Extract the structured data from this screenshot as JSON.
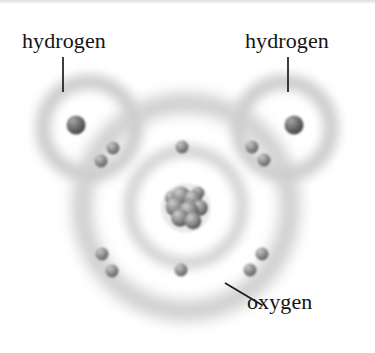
{
  "figure": {
    "background_color": "#ffffff",
    "ink_color": "#141414",
    "shell_color": "#b9b9b9",
    "electron_color": "#8a8a8a",
    "nucleus_color": "#707070",
    "width": 375,
    "height": 353
  },
  "labels": {
    "hydrogen_left": "hydrogen",
    "hydrogen_right": "hydrogen",
    "oxygen": "oxygen"
  },
  "leader_lines": [
    {
      "name": "hydrogen-left-leader",
      "x1": 63,
      "y1": 57,
      "x2": 63,
      "y2": 92
    },
    {
      "name": "hydrogen-right-leader",
      "x1": 288,
      "y1": 57,
      "x2": 288,
      "y2": 92
    },
    {
      "name": "oxygen-leader",
      "x1": 225,
      "y1": 283,
      "x2": 262,
      "y2": 305
    }
  ],
  "atoms": {
    "oxygen": {
      "name": "oxygen",
      "nucleus": {
        "cx": 186,
        "cy": 207,
        "r": 23
      },
      "shells": [
        {
          "name": "oxygen-inner-shell",
          "cx": 186,
          "cy": 207,
          "r": 56,
          "thickness": 9
        },
        {
          "name": "oxygen-outer-shell",
          "cx": 186,
          "cy": 207,
          "r": 104,
          "thickness": 14
        }
      ]
    },
    "hydrogen_left": {
      "name": "hydrogen-left",
      "shells": [
        {
          "name": "hydrogen-left-shell",
          "cx": 89,
          "cy": 128,
          "r": 46,
          "thickness": 11
        }
      ],
      "electron": {
        "cx": 76,
        "cy": 125,
        "r": 9.5
      }
    },
    "hydrogen_right": {
      "name": "hydrogen-right",
      "shells": [
        {
          "name": "hydrogen-right-shell",
          "cx": 285,
          "cy": 128,
          "r": 46,
          "thickness": 11
        }
      ],
      "electron": {
        "cx": 294,
        "cy": 125,
        "r": 9.5
      }
    }
  },
  "electrons": [
    {
      "name": "electron-shared-upper-left-outer",
      "cx": 113,
      "cy": 148,
      "r": 6.5
    },
    {
      "name": "electron-shared-upper-left-inner",
      "cx": 101,
      "cy": 161,
      "r": 6.5
    },
    {
      "name": "electron-outer-top-center",
      "cx": 182,
      "cy": 147,
      "r": 6.5
    },
    {
      "name": "electron-shared-upper-right-outer",
      "cx": 252,
      "cy": 147,
      "r": 6.5
    },
    {
      "name": "electron-shared-upper-right-inner",
      "cx": 264,
      "cy": 160,
      "r": 6.5
    },
    {
      "name": "electron-outer-lower-left-upper",
      "cx": 102,
      "cy": 254,
      "r": 6.5
    },
    {
      "name": "electron-outer-lower-left-lower",
      "cx": 112,
      "cy": 271,
      "r": 6.5
    },
    {
      "name": "electron-outer-bottom-center",
      "cx": 181,
      "cy": 270,
      "r": 6.5
    },
    {
      "name": "electron-outer-lower-right-upper",
      "cx": 262,
      "cy": 254,
      "r": 6.5
    },
    {
      "name": "electron-outer-lower-right-lower",
      "cx": 250,
      "cy": 270,
      "r": 6.5
    }
  ],
  "nucleons": [
    {
      "cx": 181,
      "cy": 196,
      "r": 9.5
    },
    {
      "cx": 193,
      "cy": 199,
      "r": 9.0
    },
    {
      "cx": 175,
      "cy": 207,
      "r": 9.5
    },
    {
      "cx": 189,
      "cy": 211,
      "r": 10.0
    },
    {
      "cx": 200,
      "cy": 208,
      "r": 8.0
    },
    {
      "cx": 180,
      "cy": 218,
      "r": 9.0
    },
    {
      "cx": 193,
      "cy": 221,
      "r": 8.5
    },
    {
      "cx": 172,
      "cy": 198,
      "r": 7.0
    },
    {
      "cx": 198,
      "cy": 193,
      "r": 6.5
    }
  ]
}
